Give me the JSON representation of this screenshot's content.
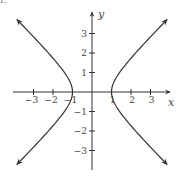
{
  "corner_fragment": "r.",
  "chart_data": {
    "type": "line",
    "title": "",
    "equation": "x^2 - y^2 = 1",
    "xlabel": "x",
    "ylabel": "y",
    "xlim": [
      -4,
      4
    ],
    "ylim": [
      -4,
      4
    ],
    "grid": false,
    "xticks": [
      -3,
      -2,
      -1,
      1,
      2,
      3
    ],
    "yticks": [
      -3,
      -2,
      -1,
      1,
      2,
      3
    ],
    "xtick_labels": [
      "−3",
      "−2",
      "−1",
      "1",
      "2",
      "3"
    ],
    "ytick_labels": [
      "−3",
      "−2",
      "−1",
      "1",
      "2",
      "3"
    ],
    "series": [
      {
        "name": "right branch",
        "x": [
          3.7,
          3.0,
          2.0,
          1.5,
          1.0,
          1.5,
          2.0,
          3.0,
          3.7
        ],
        "y": [
          3.56,
          2.83,
          1.73,
          1.12,
          0,
          -1.12,
          -1.73,
          -2.83,
          -3.56
        ]
      },
      {
        "name": "left branch",
        "x": [
          -3.7,
          -3.0,
          -2.0,
          -1.5,
          -1.0,
          -1.5,
          -2.0,
          -3.0,
          -3.7
        ],
        "y": [
          3.56,
          2.83,
          1.73,
          1.12,
          0,
          -1.12,
          -1.73,
          -2.83,
          -3.56
        ]
      }
    ],
    "arrows": "both ends of each branch and positive ends of both axes",
    "colors": {
      "axis": "#333333",
      "curve": "#333333",
      "text": "#444444"
    }
  }
}
